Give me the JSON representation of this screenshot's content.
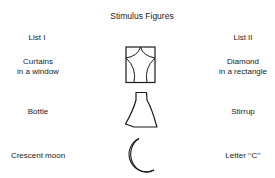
{
  "title": "Stimulus Figures",
  "columns": {
    "list1": "List I",
    "list2": "List II"
  },
  "rows": [
    {
      "figure": "diamond-in-rectangle",
      "list1_line1": "Curtains",
      "list1_line2": "in a window",
      "list2_line1": "Diamond",
      "list2_line2": "in a rectangle"
    },
    {
      "figure": "bottle-stirrup",
      "list1_line1": "Bottle",
      "list2_line1": "Stirrup"
    },
    {
      "figure": "crescent-c",
      "list1_line1": "Crescent moon",
      "list2_line1": "Letter ‘‘C’’"
    }
  ],
  "colors": {
    "ink": "#1a1a1a",
    "background": "#ffffff"
  }
}
